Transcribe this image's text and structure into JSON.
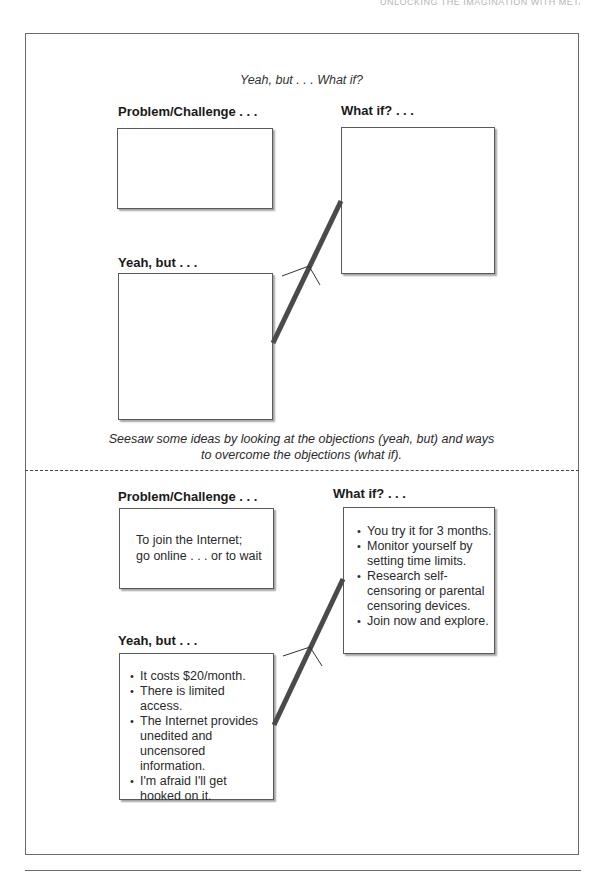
{
  "page": {
    "running_head": "UNLOCKING THE IMAGINATION WITH METAPHOR"
  },
  "top_section": {
    "title": "Yeah, but . . . What if?",
    "problem_label": "Problem/Challenge . . .",
    "whatif_label": "What if? . . .",
    "yeahbut_label": "Yeah, but . . .",
    "problem_text": "",
    "whatif_items": [],
    "yeahbut_items": []
  },
  "caption": {
    "line1": "Seesaw some ideas by looking at the objections (yeah, but) and ways",
    "line2": "to overcome the objections (what if)."
  },
  "example_section": {
    "problem_label": "Problem/Challenge . . .",
    "problem_text_line1": "To join the Internet;",
    "problem_text_line2": "go online . . . or to wait",
    "whatif_label": "What if? . . .",
    "whatif_items": [
      "You try it for 3 months.",
      "Monitor yourself by setting time limits.",
      "Research self-censoring or parental censoring devices.",
      "Join now and explore."
    ],
    "yeahbut_label": "Yeah, but . . .",
    "yeahbut_items": [
      "It costs $20/month.",
      "There is limited access.",
      "The Internet provides unedited and uncensored information.",
      "I'm afraid I'll get hooked on it."
    ]
  },
  "colors": {
    "frame": "#6a6a6a",
    "box_border": "#5a5a5a",
    "seesaw_beam": "#4a4a4a",
    "text": "#1e1e1e"
  }
}
